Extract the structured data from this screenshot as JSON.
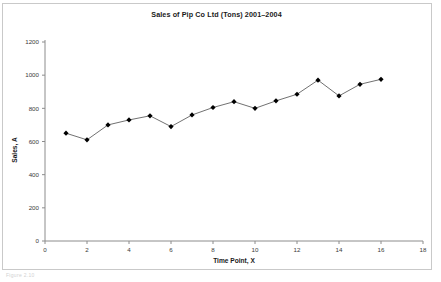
{
  "figure": {
    "caption_fragment": "Figure 2.10"
  },
  "chart_data": {
    "type": "line",
    "title": "Sales of Pip Co Ltd (Tons) 2001–2004",
    "xlabel": "Time Point, X",
    "ylabel": "Sales, A",
    "x": [
      1,
      2,
      3,
      4,
      5,
      6,
      7,
      8,
      9,
      10,
      11,
      12,
      13,
      14,
      15,
      16
    ],
    "values": [
      650,
      610,
      700,
      730,
      755,
      690,
      760,
      805,
      840,
      800,
      845,
      885,
      970,
      875,
      945,
      975
    ],
    "xlim": [
      0,
      18
    ],
    "ylim": [
      0,
      1200
    ],
    "xticks": [
      0,
      2,
      4,
      6,
      8,
      10,
      12,
      14,
      16,
      18
    ],
    "yticks": [
      0,
      200,
      400,
      600,
      800,
      1000,
      1200
    ],
    "grid": false,
    "legend": null,
    "marker": "diamond",
    "marker_color": "#000000",
    "line_color": "#4d4d4d",
    "axis_color": "#8c8c8c"
  }
}
